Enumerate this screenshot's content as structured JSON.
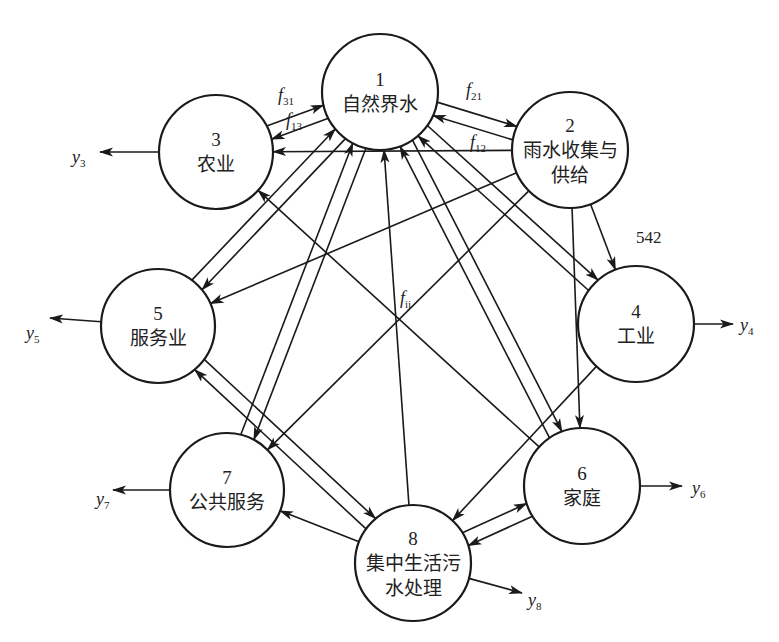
{
  "diagram": {
    "title": "",
    "nodes": [
      {
        "id": 1,
        "num": "1",
        "label_lines": [
          "自然界水"
        ],
        "cx": 380,
        "cy": 92,
        "r": 58
      },
      {
        "id": 2,
        "num": "2",
        "label_lines": [
          "雨水收集与",
          "供给"
        ],
        "cx": 570,
        "cy": 150,
        "r": 58
      },
      {
        "id": 3,
        "num": "3",
        "label_lines": [
          "农业"
        ],
        "cx": 216,
        "cy": 152,
        "r": 57
      },
      {
        "id": 4,
        "num": "4",
        "label_lines": [
          "工业"
        ],
        "cx": 636,
        "cy": 324,
        "r": 58
      },
      {
        "id": 5,
        "num": "5",
        "label_lines": [
          "服务业"
        ],
        "cx": 158,
        "cy": 326,
        "r": 57
      },
      {
        "id": 6,
        "num": "6",
        "label_lines": [
          "家庭"
        ],
        "cx": 582,
        "cy": 486,
        "r": 58
      },
      {
        "id": 7,
        "num": "7",
        "label_lines": [
          "公共服务"
        ],
        "cx": 227,
        "cy": 490,
        "r": 57
      },
      {
        "id": 8,
        "num": "8",
        "label_lines": [
          "集中生活污",
          "水处理"
        ],
        "cx": 413,
        "cy": 563,
        "r": 58
      }
    ],
    "edges": [
      {
        "from": 1,
        "to": 3,
        "offset": -7
      },
      {
        "from": 3,
        "to": 1,
        "offset": -7
      },
      {
        "from": 1,
        "to": 2,
        "offset": -7
      },
      {
        "from": 2,
        "to": 1,
        "offset": -7
      },
      {
        "from": 2,
        "to": 3,
        "offset": 0
      },
      {
        "from": 1,
        "to": 5,
        "offset": -7
      },
      {
        "from": 5,
        "to": 1,
        "offset": -7
      },
      {
        "from": 1,
        "to": 7,
        "offset": -7
      },
      {
        "from": 7,
        "to": 1,
        "offset": -7
      },
      {
        "from": 8,
        "to": 1,
        "offset": 0
      },
      {
        "from": 1,
        "to": 6,
        "offset": -7
      },
      {
        "from": 6,
        "to": 1,
        "offset": -7
      },
      {
        "from": 1,
        "to": 4,
        "offset": -7
      },
      {
        "from": 4,
        "to": 1,
        "offset": -7
      },
      {
        "from": 2,
        "to": 4,
        "offset": 0
      },
      {
        "from": 2,
        "to": 5,
        "offset": 0
      },
      {
        "from": 2,
        "to": 7,
        "offset": 0
      },
      {
        "from": 2,
        "to": 6,
        "offset": 0
      },
      {
        "from": 6,
        "to": 3,
        "offset": 0
      },
      {
        "from": 4,
        "to": 8,
        "offset": 0
      },
      {
        "from": 5,
        "to": 8,
        "offset": -7
      },
      {
        "from": 8,
        "to": 5,
        "offset": -7
      },
      {
        "from": 8,
        "to": 7,
        "offset": 0
      },
      {
        "from": 6,
        "to": 8,
        "offset": -7
      },
      {
        "from": 8,
        "to": 6,
        "offset": -7
      }
    ],
    "outputs": [
      {
        "node": 3,
        "label": "y",
        "sub": "3",
        "x2": 100,
        "y2": 152,
        "lx": 72,
        "ly": 163
      },
      {
        "node": 5,
        "label": "y",
        "sub": "5",
        "x2": 50,
        "y2": 318,
        "lx": 26,
        "ly": 339
      },
      {
        "node": 4,
        "label": "y",
        "sub": "4",
        "x2": 733,
        "y2": 324,
        "lx": 740,
        "ly": 331
      },
      {
        "node": 7,
        "label": "y",
        "sub": "7",
        "x2": 113,
        "y2": 490,
        "lx": 96,
        "ly": 505
      },
      {
        "node": 6,
        "label": "y",
        "sub": "6",
        "x2": 682,
        "y2": 486,
        "lx": 692,
        "ly": 494
      },
      {
        "node": 8,
        "label": "y",
        "sub": "8",
        "x2": 522,
        "y2": 593,
        "lx": 528,
        "ly": 606
      }
    ],
    "flow_labels": [
      {
        "text": "f",
        "sub": "31",
        "x": 278,
        "y": 101
      },
      {
        "text": "f",
        "sub": "13",
        "x": 286,
        "y": 126
      },
      {
        "text": "f",
        "sub": "21",
        "x": 466,
        "y": 96
      },
      {
        "text": "f",
        "sub": "12",
        "x": 470,
        "y": 148
      },
      {
        "text": "f",
        "sub": "ij",
        "x": 400,
        "y": 304
      }
    ],
    "value_labels": [
      {
        "text": "542",
        "x": 636,
        "y": 243
      }
    ]
  }
}
